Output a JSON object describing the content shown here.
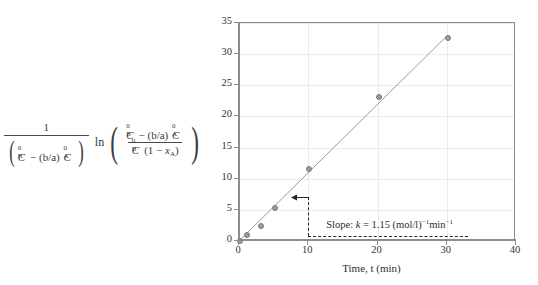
{
  "formula": {
    "numerator_outer": "1",
    "denominator_outer_open": "(",
    "denominator_outer_close": ")",
    "denom_C_B": "C",
    "denom_C_B_sub": "B",
    "denom_C_B_sup": "0",
    "denom_minus": "− (b/a)",
    "denom_C_A": "C",
    "denom_C_A_sub": "A",
    "denom_C_A_sup": "0",
    "ln_operator": "ln",
    "big_open_paren": "(",
    "big_close_paren": ")",
    "arg_num_C_B": "C",
    "arg_num_C_B_sub": "B",
    "arg_num_C_B_sup": "0",
    "arg_num_minus": "− (b/a)",
    "arg_num_C_A": "C",
    "arg_num_C_A_sub": "A",
    "arg_num_C_A_sup": "0",
    "arg_den_C_B": "C",
    "arg_den_C_B_sub": "B",
    "arg_den_C_B_sup": "0",
    "arg_den_rest_open": "(1 − ",
    "arg_den_x": "x",
    "arg_den_x_sub": "A",
    "arg_den_rest_close": ")"
  },
  "chart_data": {
    "type": "scatter",
    "title": "",
    "xlabel": "Time, t (min)",
    "ylabel": "",
    "xlim": [
      0,
      40
    ],
    "ylim": [
      0,
      35
    ],
    "xticks": [
      0,
      10,
      20,
      30,
      40
    ],
    "yticks": [
      0,
      5,
      10,
      15,
      20,
      25,
      30,
      35
    ],
    "xtick_labels": [
      "0",
      "10",
      "20",
      "30",
      "40"
    ],
    "ytick_labels": [
      "0",
      "5",
      "10",
      "15",
      "20",
      "25",
      "30",
      "35"
    ],
    "grid": true,
    "legend": "none",
    "series": [
      {
        "name": "data",
        "x": [
          0,
          1,
          3,
          5,
          10,
          20,
          30
        ],
        "y": [
          0.2,
          1.2,
          2.6,
          5.4,
          11.8,
          23.3,
          32.7
        ],
        "marker": "circle",
        "color": "#9a9a9a"
      },
      {
        "name": "linear fit",
        "type": "line",
        "x": [
          0,
          30
        ],
        "y": [
          0,
          32.9
        ],
        "color": "#9a9a9a"
      }
    ],
    "annotations": [
      {
        "name": "slope-annotation",
        "text": "Slope: k = 1.15 (mol/l)⁻¹min⁻¹",
        "slope_prefix": "Slope: ",
        "slope_symbol": "k",
        "slope_eq": " = 1.15 (mol/l)",
        "slope_exp1": "−1",
        "slope_unit": "min",
        "slope_exp2": "−1",
        "guide_x": 10,
        "guide_y_bottom": 0.8,
        "guide_y_top": 7.0,
        "guide_x_right": 33
      }
    ]
  },
  "colors": {
    "axis": "#8c8c8c",
    "grid": "#eceaea",
    "data": "#9a9a9a",
    "annotation": "#262626",
    "text": "#2b2b2b"
  }
}
